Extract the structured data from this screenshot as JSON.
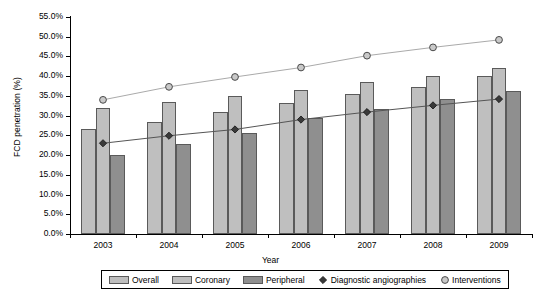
{
  "chart_data": {
    "type": "bar",
    "title": "",
    "xlabel": "Year",
    "ylabel": "FCD penetration (%)",
    "categories": [
      "2003",
      "2004",
      "2005",
      "2006",
      "2007",
      "2008",
      "2009"
    ],
    "ylim": [
      0,
      55
    ],
    "ytick_values": [
      0,
      5,
      10,
      15,
      20,
      25,
      30,
      35,
      40,
      45,
      50,
      55
    ],
    "ytick_labels": [
      "0.0%",
      "5.0%",
      "10.0%",
      "15.0%",
      "20.0%",
      "25.0%",
      "30.0%",
      "35.0%",
      "40.0%",
      "45.0%",
      "50.0%",
      "55.0%"
    ],
    "grid": false,
    "legend_position": "bottom",
    "bar_series": [
      {
        "name": "Overall",
        "key": "overall",
        "color": "#bfbfbf",
        "values": [
          26.5,
          28.5,
          31.0,
          33.2,
          35.4,
          37.3,
          40.0
        ]
      },
      {
        "name": "Coronary",
        "key": "coronary",
        "color": "#bfbfbf",
        "values": [
          32.0,
          33.5,
          35.0,
          36.4,
          38.5,
          40.0,
          42.0
        ]
      },
      {
        "name": "Peripheral",
        "key": "peripheral",
        "color": "#8f8f8f",
        "values": [
          20.0,
          22.7,
          25.5,
          29.5,
          31.6,
          34.3,
          36.2
        ]
      }
    ],
    "line_series": [
      {
        "name": "Diagnostic angiographies",
        "key": "diagnostic",
        "marker": "diamond",
        "color": "#3a3a3a",
        "values": [
          23.0,
          24.9,
          26.5,
          29.0,
          30.9,
          32.6,
          34.2
        ]
      },
      {
        "name": "Interventions",
        "key": "interventions",
        "marker": "circle",
        "color": "#9a9a9a",
        "values": [
          34.0,
          37.3,
          39.8,
          42.2,
          45.2,
          47.3,
          49.2
        ]
      }
    ]
  },
  "legend": {
    "items": [
      {
        "label": "Overall",
        "type": "swatch-light"
      },
      {
        "label": "Coronary",
        "type": "swatch-light"
      },
      {
        "label": "Peripheral",
        "type": "swatch-dark"
      },
      {
        "label": "Diagnostic angiographies",
        "type": "diamond"
      },
      {
        "label": "Interventions",
        "type": "circle"
      }
    ]
  }
}
